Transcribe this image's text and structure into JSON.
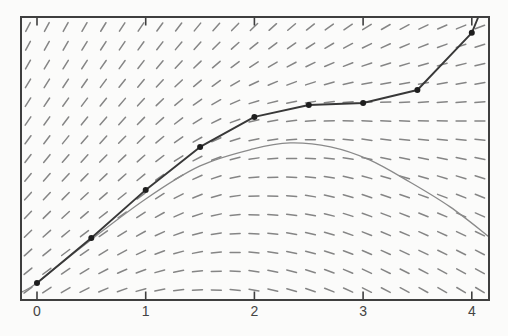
{
  "canvas": {
    "width": 508,
    "height": 336,
    "background": "#fbfbfa"
  },
  "plot": {
    "left": 21,
    "top": 17,
    "right": 489,
    "bottom": 300,
    "frame_color": "#3f3f3f",
    "frame_width": 2,
    "x_origin_px": 37,
    "px_per_x_unit": 108.7,
    "interior_height_px": 283
  },
  "axis": {
    "x_tick_values": [
      0,
      1,
      2,
      3,
      4
    ],
    "x_tick_labels": [
      "0",
      "1",
      "2",
      "3",
      "4"
    ],
    "tick_length_px": 7.5,
    "tick_color": "#3f3f3f",
    "label_color": "#444444",
    "y_axis": "no y-axis ticks or labels shown"
  },
  "slope_field": {
    "cols": 25,
    "rows": 15,
    "col_start_px": 28,
    "col_step_px": 18.83,
    "row_start_px": 27,
    "row_step_px": 18.79,
    "dash_length_px": 10,
    "dash_width_px": 1.5,
    "dash_color": "#858585",
    "slope_grid": {
      "u_px": [
        27,
        146,
        253,
        364,
        470
      ],
      "v_px": [
        30,
        105,
        190,
        290
      ],
      "s": [
        [
          1.95,
          1.45,
          0.95,
          0.62,
          0.38
        ],
        [
          1.55,
          1.05,
          0.28,
          0.0,
          0.08
        ],
        [
          1.15,
          0.75,
          0.05,
          -0.32,
          -0.38
        ],
        [
          0.75,
          0.25,
          -0.18,
          -0.5,
          -0.6
        ]
      ]
    }
  },
  "chart_data": {
    "type": "line",
    "title": "",
    "xlabel": "",
    "ylabel": "",
    "x_ticks": [
      0,
      1,
      2,
      3,
      4
    ],
    "x_range": [
      -0.15,
      4.16
    ],
    "grid": "off",
    "legend": "none",
    "background_layer": "direction (slope) field drawn as a 25 x 15 grid of short gray dashes; slopes steep-positive at upper left, near zero along a ridge through mid-plot, negative at lower right",
    "y_axis_note": "y axis is unlabeled; y values below are fractions of plot interior height measured up from the bottom frame edge",
    "series": [
      {
        "name": "numerical approximation (dotted polyline)",
        "marker": "filled black dot at each step, step size 0.5",
        "color": "#383838",
        "x": [
          0,
          0.5,
          1,
          1.5,
          2,
          2.5,
          3,
          3.5,
          4
        ],
        "y_frac": [
          0.06,
          0.219,
          0.389,
          0.541,
          0.647,
          0.689,
          0.696,
          0.742,
          0.944
        ],
        "tail_x": 4.06,
        "tail_y_frac": 1.0
      },
      {
        "name": "exact solution (smooth gray curve)",
        "marker": "none",
        "color": "#8a8a8a",
        "x": [
          -0.14,
          0,
          0.4,
          1.0,
          1.5,
          1.99,
          2.33,
          2.7,
          3.06,
          3.43,
          3.8,
          4.16
        ],
        "y_frac": [
          0.028,
          0.06,
          0.184,
          0.357,
          0.474,
          0.534,
          0.555,
          0.541,
          0.495,
          0.417,
          0.329,
          0.223
        ]
      }
    ]
  }
}
